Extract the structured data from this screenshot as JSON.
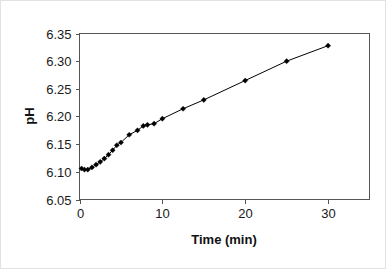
{
  "chart_data": {
    "type": "line",
    "title": "",
    "xlabel": "Time (min)",
    "ylabel": "pH",
    "xlim": [
      0,
      35
    ],
    "ylim": [
      6.05,
      6.35
    ],
    "grid": false,
    "legend": null,
    "xticks": [
      0,
      10,
      20,
      30
    ],
    "xtick_labels": [
      "0",
      "10",
      "20",
      "30"
    ],
    "yticks": [
      6.05,
      6.1,
      6.15,
      6.2,
      6.25,
      6.3,
      6.35
    ],
    "ytick_labels": [
      "6.05",
      "6.10",
      "6.15",
      "6.20",
      "6.25",
      "6.30",
      "6.35"
    ],
    "marker": "filled-diamond",
    "line_color": "#000000",
    "marker_color": "#000000",
    "series": [
      {
        "name": "pH vs time",
        "x": [
          0.25,
          0.6,
          1.0,
          1.5,
          2.0,
          2.5,
          3.0,
          3.5,
          4.0,
          4.5,
          5.0,
          6.0,
          7.0,
          7.7,
          8.2,
          9.0,
          10.0,
          12.5,
          15.0,
          20.0,
          25.0,
          30.0
        ],
        "y": [
          6.106,
          6.104,
          6.104,
          6.108,
          6.113,
          6.118,
          6.124,
          6.131,
          6.139,
          6.148,
          6.153,
          6.167,
          6.175,
          6.183,
          6.185,
          6.187,
          6.196,
          6.214,
          6.23,
          6.265,
          6.3,
          6.328
        ]
      }
    ]
  }
}
